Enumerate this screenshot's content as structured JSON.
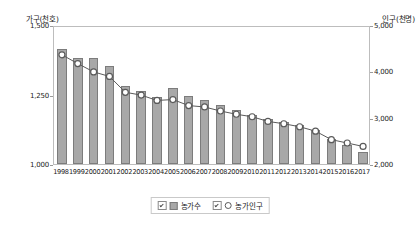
{
  "chart_data": {
    "type": "bar",
    "title": "",
    "subtitle": "",
    "categories": [
      "1998",
      "1999",
      "2000",
      "2001",
      "2002",
      "2003",
      "2004",
      "2005",
      "2006",
      "2007",
      "2008",
      "2009",
      "2010",
      "2011",
      "2012",
      "2013",
      "2014",
      "2015",
      "2016",
      "2017"
    ],
    "xlabel": "",
    "grid": false,
    "legend_position": "bottom-center",
    "axes": {
      "left": {
        "title": "가구(천호)",
        "ticks": [
          "1,500",
          "1,250",
          "1,000"
        ],
        "tick_values": [
          1500,
          1250,
          1000
        ],
        "ylim": [
          1000,
          1500
        ],
        "ylabel": "가구(천호)"
      },
      "right": {
        "title": "인구(천명)",
        "ticks": [
          "5,000",
          "4,000",
          "3,000",
          "2,000"
        ],
        "tick_values": [
          5000,
          4000,
          3000,
          2000
        ],
        "ylim": [
          2000,
          5000
        ],
        "ylabel": "인구(천명)"
      }
    },
    "series": [
      {
        "name": "농가수",
        "kind": "bar",
        "axis": "left",
        "unit": "천호",
        "color": "#a8a8a8",
        "values": [
          1413,
          1382,
          1383,
          1354,
          1280,
          1264,
          1240,
          1273,
          1245,
          1231,
          1212,
          1195,
          1177,
          1163,
          1151,
          1142,
          1121,
          1089,
          1068,
          1042
        ]
      },
      {
        "name": "농가인구",
        "kind": "line",
        "axis": "right",
        "unit": "천명",
        "color": "#5a5a5a",
        "marker": "circle",
        "values": [
          4400,
          4210,
          4031,
          3933,
          3591,
          3530,
          3415,
          3434,
          3304,
          3274,
          3187,
          3117,
          3063,
          2962,
          2912,
          2847,
          2752,
          2569,
          2496,
          2422
        ]
      }
    ]
  },
  "legend": {
    "items": [
      {
        "label": "농가수",
        "marker": "bar-swatch"
      },
      {
        "label": "농가인구",
        "marker": "circle-outline"
      }
    ]
  }
}
